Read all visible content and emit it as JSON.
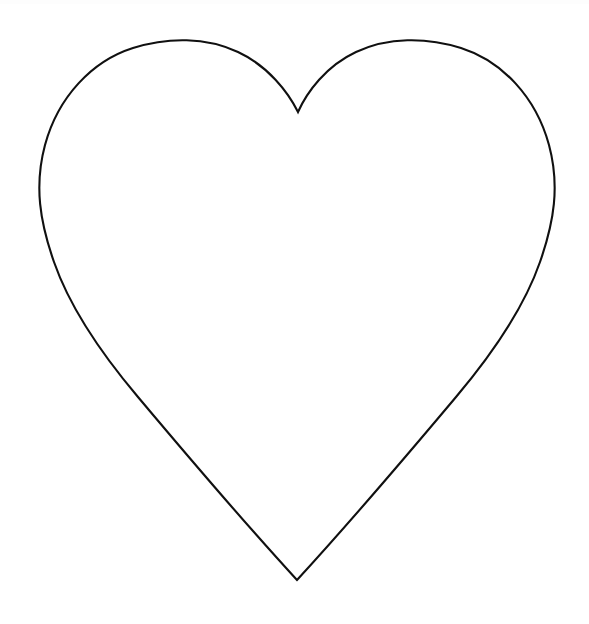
{
  "document": {
    "kind": "line-art-drawing",
    "subject": "heart-outline",
    "title": "Heart Outline",
    "canvas": {
      "width": 589,
      "height": 624,
      "background_color": "#ffffff"
    }
  },
  "drawing": {
    "shape_name": "heart",
    "fill": "none",
    "fill_color": "#ffffff",
    "stroke_color": "#101010",
    "stroke_width": 2.1,
    "stroke_linejoin": "miter",
    "stroke_linecap": "round",
    "anchor_points": {
      "top_cleft": {
        "x": 298,
        "y": 112
      },
      "left_lobe_apex": {
        "x": 172,
        "y": 41
      },
      "right_lobe_apex": {
        "x": 428,
        "y": 41
      },
      "leftmost": {
        "x": 42,
        "y": 228
      },
      "rightmost": {
        "x": 554,
        "y": 230
      },
      "bottom_tip": {
        "x": 297,
        "y": 580
      }
    },
    "path": "M 298 112 C 288 92 268 66 238 52 C 206 37 168 37 133 48 C 92 61 58 97 45 145 C 34 186 40 222 54 262 C 70 308 100 352 138 397 C 180 447 240 518 297 580 C 354 518 414 447 456 397 C 494 352 524 308 540 262 C 554 222 560 186 549 145 C 536 97 502 61 461 48 C 426 37 388 37 356 52 C 326 66 307 92 298 112 Z"
  },
  "palette": {
    "background": "#ffffff",
    "ink": "#101010",
    "top_band_tint": "#fdfdfd"
  }
}
